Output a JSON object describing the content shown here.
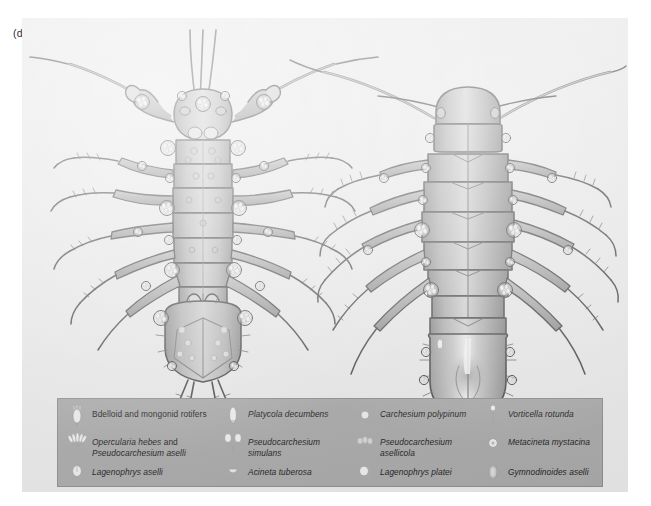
{
  "figure": {
    "panel_letter": "(d)",
    "panel_background": "#e8e8e8",
    "legend_background": "#a9a9a9",
    "ink_color": "#4a4a4a"
  },
  "specimens": [
    {
      "name": "isopod-ventral-view",
      "view": "ventral",
      "description": "Asellus aquaticus ventral aspect with pereopods, pleopods, uropods and epibiont colonies"
    },
    {
      "name": "isopod-dorsal-view",
      "view": "dorsal",
      "description": "Asellus aquaticus dorsal aspect with segmented pereonites, pleotelson and epibiont colonies"
    }
  ],
  "legend": {
    "rows": [
      [
        {
          "icon": "bdelloid-rotifer-icon",
          "parts": [
            {
              "text": "Bdelloid and mongonid rotifers",
              "style": "roman"
            }
          ]
        },
        {
          "icon": "platycola-decumbens-icon",
          "parts": [
            {
              "text": "Platycola decumbens",
              "style": "italic"
            }
          ]
        },
        {
          "icon": "carchesium-polypinum-icon",
          "parts": [
            {
              "text": "Carchesium polypinum",
              "style": "italic"
            }
          ]
        },
        {
          "icon": "vorticella-rotunda-icon",
          "parts": [
            {
              "text": "Vorticella rotunda",
              "style": "italic"
            }
          ]
        }
      ],
      [
        {
          "icon": "opercularia-hebes-icon",
          "parts": [
            {
              "text": "Opercularia hebes",
              "style": "italic"
            },
            {
              "text": " and",
              "style": "roman"
            },
            {
              "text": "\nPseudocarchesium aselli",
              "style": "italic"
            }
          ]
        },
        {
          "icon": "pseudocarchesium-simulans-icon",
          "parts": [
            {
              "text": "Pseudocarchesium\nsimulans",
              "style": "italic"
            }
          ]
        },
        {
          "icon": "pseudocarchesium-asellicola-icon",
          "parts": [
            {
              "text": "Pseudocarchesium\nasellicola",
              "style": "italic"
            }
          ]
        },
        {
          "icon": "metacineta-mystacina-icon",
          "parts": [
            {
              "text": "Metacineta mystacina",
              "style": "italic"
            }
          ]
        }
      ],
      [
        {
          "icon": "lagenophrys-aselli-icon",
          "parts": [
            {
              "text": "Lagenophrys aselli",
              "style": "italic"
            }
          ]
        },
        {
          "icon": "acineta-tuberosa-icon",
          "parts": [
            {
              "text": "Acineta tuberosa",
              "style": "italic"
            }
          ]
        },
        {
          "icon": "lagenophrys-platei-icon",
          "parts": [
            {
              "text": "Lagenophrys platei",
              "style": "italic"
            }
          ]
        },
        {
          "icon": "gymnodinoides-aselli-icon",
          "parts": [
            {
              "text": "Gymnodinoides aselli",
              "style": "italic"
            }
          ]
        }
      ]
    ]
  }
}
